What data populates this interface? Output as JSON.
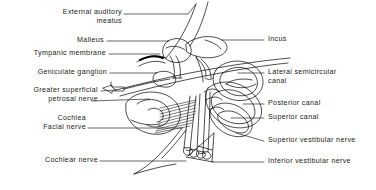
{
  "figure": {
    "type": "anatomical-line-diagram",
    "style": "black-and-white line drawing with leader lines to text labels",
    "background_color": "#ffffff",
    "line_color": "#000000",
    "text_color": "#1a1a1a"
  },
  "labels": {
    "left": [
      {
        "id": "external-auditory-meatus",
        "text": "External auditory\nmeatus"
      },
      {
        "id": "malleus",
        "text": "Malleus"
      },
      {
        "id": "tympanic-membrane",
        "text": "Tympanic membrane"
      },
      {
        "id": "geniculate-ganglion",
        "text": "Geniculate ganglion"
      },
      {
        "id": "greater-superficial-petrosal-nerve",
        "text": "Greater superficial\npetrosal nerve"
      },
      {
        "id": "cochlea",
        "text": "Cochlea"
      },
      {
        "id": "facial-nerve",
        "text": "Facial nerve"
      },
      {
        "id": "cochlear-nerve",
        "text": "Cochlear nerve"
      }
    ],
    "right": [
      {
        "id": "incus",
        "text": "Incus"
      },
      {
        "id": "lateral-semicircular-canal",
        "text": "Lateral semicircular\ncanal"
      },
      {
        "id": "posterior-canal",
        "text": "Posterior canal"
      },
      {
        "id": "superior-canal",
        "text": "Superior canal"
      },
      {
        "id": "superior-vestibular-nerve",
        "text": "Superior vestibular nerve"
      },
      {
        "id": "inferior-vestibular-nerve",
        "text": "Inferior vestibular nerve"
      }
    ]
  },
  "markers": {
    "petrosal_arrow": "left-pointing-outline-arrow"
  }
}
